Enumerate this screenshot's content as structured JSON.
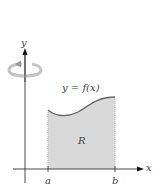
{
  "diagram": {
    "axes": {
      "x_label": "x",
      "y_label": "y"
    },
    "curve_label": "y = f(x)",
    "region_label": "R",
    "interval": {
      "start_label": "a",
      "end_label": "b"
    },
    "rotation_indicator": "rotation-about-y-axis",
    "colors": {
      "region_fill": "#d9d9d9",
      "curve": "#666666",
      "axes": "#333333",
      "rotation_arrow": "#bbbbbb"
    }
  }
}
